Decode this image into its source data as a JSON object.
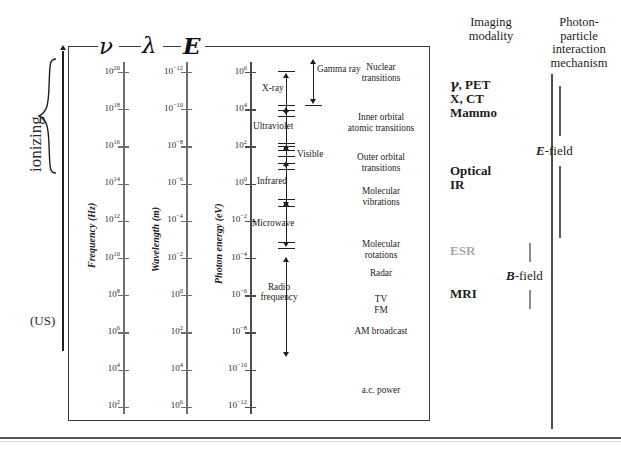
{
  "figure": {
    "title_symbols": [
      {
        "name": "frequency-symbol",
        "glyph": "ν"
      },
      {
        "name": "wavelength-symbol",
        "glyph": "λ"
      },
      {
        "name": "energy-symbol",
        "glyph": "E"
      }
    ],
    "ionizing_label": "ionizing",
    "us_label": "(US)"
  },
  "chart_data": {
    "type": "table",
    "axes": [
      {
        "name": "frequency",
        "symbol": "ν",
        "title": "Frequency (Hz)",
        "unit": "Hz",
        "scale": "log10",
        "tick_exponents": [
          20,
          18,
          16,
          14,
          12,
          10,
          8,
          6,
          4,
          2
        ],
        "tick_labels": [
          "10^20",
          "10^18",
          "10^16",
          "10^14",
          "10^12",
          "10^10",
          "10^8",
          "10^6",
          "10^4",
          "10^2"
        ]
      },
      {
        "name": "wavelength",
        "symbol": "λ",
        "title": "Wavelength (m)",
        "unit": "m",
        "scale": "log10",
        "tick_exponents": [
          -12,
          -10,
          -8,
          -6,
          -4,
          -2,
          0,
          2,
          4,
          6
        ],
        "tick_labels": [
          "10^-12",
          "10^-10",
          "10^-8",
          "10^-6",
          "10^-4",
          "10^-2",
          "10^0",
          "10^2",
          "10^4",
          "10^6"
        ]
      },
      {
        "name": "photon-energy",
        "symbol": "E",
        "title": "Photon energy (eV)",
        "unit": "eV",
        "scale": "log10",
        "tick_exponents": [
          6,
          4,
          2,
          0,
          -2,
          -4,
          -6,
          -8,
          -10,
          -12
        ],
        "tick_labels": [
          "10^6",
          "10^4",
          "10^2",
          "10^0",
          "10^-2",
          "10^-4",
          "10^-6",
          "10^-8",
          "10^-10",
          "10^-12"
        ]
      }
    ],
    "bands": [
      {
        "label": "Gamma ray",
        "freq_exponent_range": [
          19,
          22
        ]
      },
      {
        "label": "X-ray",
        "freq_exponent_range": [
          16.5,
          20
        ]
      },
      {
        "label": "Ultraviolet",
        "freq_exponent_range": [
          14.8,
          16.6
        ]
      },
      {
        "label": "Visible",
        "freq_exponent_range": [
          14.3,
          14.8
        ]
      },
      {
        "label": "Infrared",
        "freq_exponent_range": [
          11.8,
          14.3
        ]
      },
      {
        "label": "Microwave",
        "freq_exponent_range": [
          9.0,
          11.8
        ]
      },
      {
        "label": "Radio frequency",
        "freq_exponent_range": [
          1.5,
          9.0
        ]
      }
    ],
    "mechanisms": [
      {
        "label": "Nuclear transitions",
        "lines": [
          "Nuclear",
          "transitions"
        ]
      },
      {
        "label": "Inner orbital atomic transitions",
        "lines": [
          "Inner orbital",
          "atomic transitions"
        ]
      },
      {
        "label": "Outer orbital transitions",
        "lines": [
          "Outer orbital",
          "transitions"
        ]
      },
      {
        "label": "Molecular vibrations",
        "lines": [
          "Molecular",
          "vibrations"
        ]
      },
      {
        "label": "Molecular rotations",
        "lines": [
          "Molecular",
          "rotations"
        ]
      },
      {
        "label": "Radar",
        "lines": [
          "Radar"
        ]
      },
      {
        "label": "TV FM",
        "lines": [
          "TV",
          "FM"
        ]
      },
      {
        "label": "AM broadcast",
        "lines": [
          "AM broadcast"
        ]
      },
      {
        "label": "a.c. power",
        "lines": [
          "a.c. power"
        ]
      }
    ],
    "imaging_modality": {
      "header_lines": [
        "Imaging",
        "modality"
      ],
      "entries": [
        {
          "name": "gamma-pet",
          "text": "γ, PET",
          "muted": false
        },
        {
          "name": "x-ct",
          "text": "X, CT",
          "muted": false
        },
        {
          "name": "mammo",
          "text": "Mammo",
          "muted": false
        },
        {
          "name": "optical",
          "text": "Optical",
          "muted": false
        },
        {
          "name": "ir",
          "text": "IR",
          "muted": false
        },
        {
          "name": "esr",
          "text": "ESR",
          "muted": true
        },
        {
          "name": "mri",
          "text": "MRI",
          "muted": false
        }
      ]
    },
    "photon_particle_interaction": {
      "header_lines": [
        "Photon-",
        "particle",
        "interaction",
        "mechanism"
      ],
      "entries": [
        {
          "name": "e-field",
          "bold_part": "E",
          "rest": "-field"
        },
        {
          "name": "b-field",
          "bold_part": "B",
          "rest": "-field"
        }
      ]
    },
    "colors": {
      "text": "#1d1d1d",
      "muted_text": "#a7a9ac",
      "axis": "#6d6f72",
      "axis_dark": "#4a4c4f",
      "border": "#3a3a3a",
      "rule": "#55595c"
    }
  }
}
